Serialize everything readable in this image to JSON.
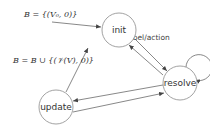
{
  "diagram": {
    "type": "state-machine",
    "colors": {
      "node_stroke": "#8a8a8a",
      "edge": "#555555",
      "text": "#333333",
      "background": "#ffffff"
    },
    "nodes": [
      {
        "id": "init",
        "label": "init"
      },
      {
        "id": "resolve",
        "label": "resolve"
      },
      {
        "id": "update",
        "label": "update"
      }
    ],
    "edges": [
      {
        "from": "start",
        "to": "init",
        "label": "B = {(V₀, 0)}"
      },
      {
        "from": "init",
        "to": "resolve",
        "label": "label/action"
      },
      {
        "from": "resolve",
        "to": "init",
        "label": ""
      },
      {
        "from": "resolve",
        "to": "resolve",
        "label": ""
      },
      {
        "from": "resolve",
        "to": "update",
        "label": ""
      },
      {
        "from": "update",
        "to": "resolve",
        "label": ""
      },
      {
        "from": "update",
        "to": "init",
        "label": "B = B ∪ {(𝒱(V), 0)}"
      }
    ],
    "labels": {
      "initial": "B = {(V₀, 0)}",
      "init_to_resolve": "label/action",
      "update_to_init": "B = B ∪ {(𝒱(V), 0)}"
    }
  }
}
